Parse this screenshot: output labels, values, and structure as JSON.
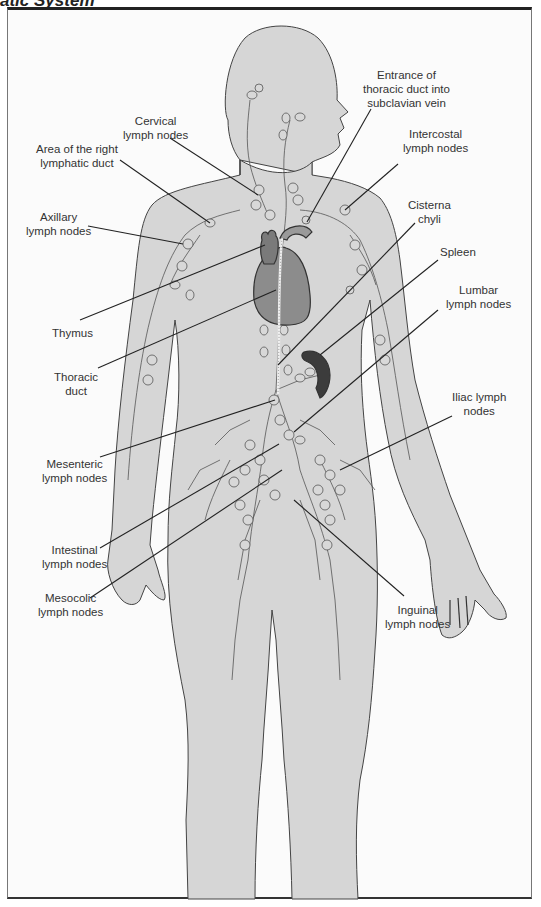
{
  "title": "atic System",
  "colors": {
    "body_fill": "#d6d6d6",
    "body_outline": "#444444",
    "vessel": "#555555",
    "node_fill": "#d8d8d8",
    "heart": "#8c8c8c",
    "thymus": "#7a7a7a",
    "spleen": "#3c3c3c",
    "leader_line": "#222222",
    "frame": "#222222"
  },
  "labels": {
    "cervical": {
      "line1": "Cervical",
      "line2": "lymph nodes"
    },
    "right_lymphatic_duct": {
      "line1": "Area of the right",
      "line2": "lymphatic duct"
    },
    "axillary": {
      "line1": "Axillary",
      "line2": "lymph nodes"
    },
    "thymus": {
      "line1": "Thymus"
    },
    "thoracic_duct": {
      "line1": "Thoracic",
      "line2": "duct"
    },
    "mesenteric": {
      "line1": "Mesenteric",
      "line2": "lymph nodes"
    },
    "intestinal": {
      "line1": "Intestinal",
      "line2": "lymph nodes"
    },
    "mesocolic": {
      "line1": "Mesocolic",
      "line2": "lymph nodes"
    },
    "entrance_thoracic": {
      "line1": "Entrance of",
      "line2": "thoracic duct into",
      "line3": "subclavian vein"
    },
    "intercostal": {
      "line1": "Intercostal",
      "line2": "lymph nodes"
    },
    "cisterna_chyli": {
      "line1": "Cisterna",
      "line2": "chyli"
    },
    "spleen": {
      "line1": "Spleen"
    },
    "lumbar": {
      "line1": "Lumbar",
      "line2": "lymph nodes"
    },
    "iliac": {
      "line1": "Iliac lymph",
      "line2": "nodes"
    },
    "inguinal": {
      "line1": "Inguinal",
      "line2": "lymph nodes"
    }
  }
}
